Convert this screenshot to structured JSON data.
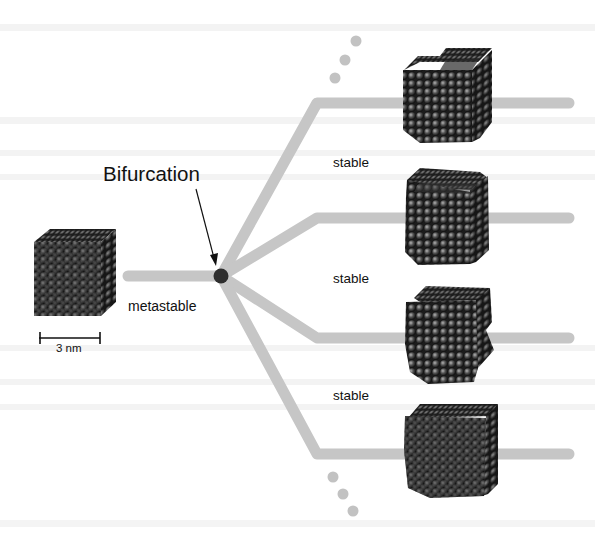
{
  "figure": {
    "title_label": "Bifurcation",
    "initial_state_label": "metastable",
    "branch_labels": [
      "stable",
      "stable",
      "stable"
    ],
    "scale_bar": {
      "label": "3 nm"
    },
    "colors": {
      "background": "#ffffff",
      "path": "#c6c6c6",
      "continuation_dots": "#c2c2c2",
      "node": "#2e2e2e",
      "text": "#111111",
      "atom_dark": "#1c1c1c",
      "atom_light": "#8a8a8a"
    },
    "node": {
      "x": 221,
      "y": 276,
      "r": 7
    },
    "initial_cube": {
      "x": 34,
      "y": 229,
      "size": 82
    },
    "branches": [
      {
        "id": "branch-1",
        "corner": [
          317,
          103
        ],
        "end": [
          569,
          103
        ],
        "cube": {
          "x": 402,
          "y": 47,
          "w": 92,
          "h": 96,
          "shape": "truncated-top"
        }
      },
      {
        "id": "branch-2",
        "corner": [
          317,
          218
        ],
        "end": [
          569,
          218
        ],
        "cube": {
          "x": 405,
          "y": 167,
          "w": 86,
          "h": 98,
          "shape": "sheared-top"
        }
      },
      {
        "id": "branch-3",
        "corner": [
          317,
          338
        ],
        "end": [
          569,
          338
        ],
        "cube": {
          "x": 405,
          "y": 284,
          "w": 90,
          "h": 100,
          "shape": "irregular-side"
        }
      },
      {
        "id": "branch-4",
        "corner": [
          317,
          454
        ],
        "end": [
          569,
          454
        ],
        "cube": {
          "x": 405,
          "y": 402,
          "w": 94,
          "h": 96,
          "shape": "disordered"
        }
      }
    ],
    "ellipsis_dots_top": [
      [
        356,
        41
      ],
      [
        345,
        60
      ],
      [
        335,
        78
      ]
    ],
    "ellipsis_dots_bottom": [
      [
        333,
        477
      ],
      [
        343,
        494
      ],
      [
        353,
        511
      ]
    ]
  }
}
